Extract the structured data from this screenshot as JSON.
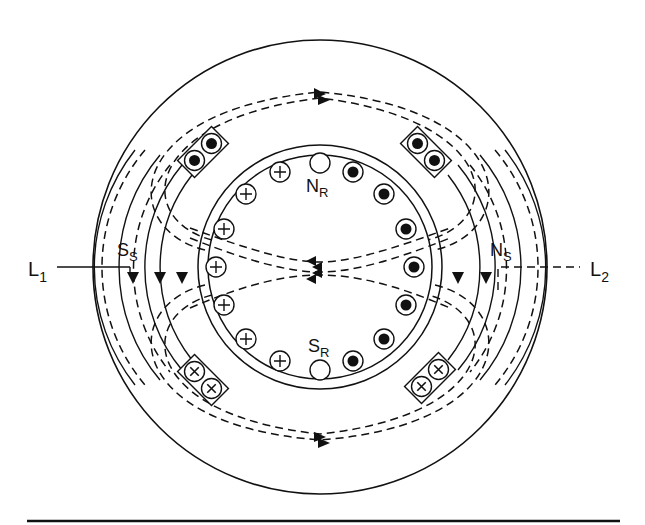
{
  "diagram": {
    "type": "two-pole induction motor cross-section with rotor and stator flux paths",
    "colors": {
      "ink": "#111111",
      "background": "#ffffff"
    },
    "labels": {
      "line1": {
        "main": "L",
        "sub": "1"
      },
      "line2": {
        "main": "L",
        "sub": "2"
      },
      "stator_south": {
        "main": "S",
        "sub": "S"
      },
      "stator_north": {
        "main": "N",
        "sub": "S"
      },
      "rotor_north": {
        "main": "N",
        "sub": "R"
      },
      "rotor_south": {
        "main": "S",
        "sub": "R"
      }
    },
    "conductor_symbols": {
      "dot": "current out of page",
      "cross": "current into page",
      "empty": "no current (pole position)"
    },
    "rotor_conductors": {
      "left_side": [
        "cross",
        "cross",
        "cross",
        "cross",
        "cross",
        "cross",
        "cross"
      ],
      "right_side": [
        "dot",
        "dot",
        "dot",
        "dot",
        "dot",
        "dot",
        "dot"
      ],
      "top": "empty",
      "bottom": "empty"
    },
    "stator_slots": {
      "top_left": [
        "dot",
        "dot"
      ],
      "top_right": [
        "dot",
        "dot"
      ],
      "bottom_left": [
        "cross",
        "cross"
      ],
      "bottom_right": [
        "cross",
        "cross"
      ]
    }
  }
}
